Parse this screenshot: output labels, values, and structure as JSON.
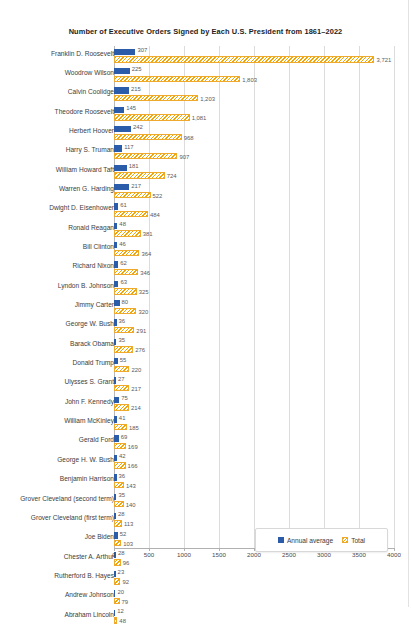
{
  "chart_data": {
    "type": "bar",
    "title": "Number of Executive Orders Signed by Each U.S. President from 1861–2022",
    "orientation": "horizontal",
    "xlabel": "",
    "ylabel": "",
    "xlim": [
      0,
      4000
    ],
    "xticks": [
      0,
      500,
      1000,
      1500,
      2000,
      2500,
      3000,
      3500,
      4000
    ],
    "grid": true,
    "legend_position": "bottom-right",
    "categories": [
      "Franklin D. Roosevelt",
      "Woodrow Wilson",
      "Calvin Coolidge",
      "Theodore Roosevelt",
      "Herbert Hoover",
      "Harry S. Truman",
      "William Howard Taft",
      "Warren G. Harding",
      "Dwight D. Eisenhower",
      "Ronald Reagan",
      "Bill Clinton",
      "Richard Nixon",
      "Lyndon B. Johnson",
      "Jimmy Carter",
      "George W. Bush",
      "Barack Obama",
      "Donald Trump",
      "Ulysses S. Grant",
      "John F. Kennedy",
      "William McKinley",
      "Gerald  Ford",
      "George H. W. Bush",
      "Benjamin Harrison",
      "Grover Cleveland (second term)",
      "Grover Cleveland (first term)",
      "Joe Biden",
      "Chester A. Arthur",
      "Rutherford B. Hayes",
      "Andrew Johnson",
      "Abraham Lincoln"
    ],
    "series": [
      {
        "name": "Annual average",
        "color": "#2a5caa",
        "values": [
          307,
          225,
          215,
          145,
          242,
          117,
          181,
          217,
          61,
          48,
          46,
          62,
          63,
          80,
          36,
          35,
          55,
          27,
          75,
          41,
          69,
          42,
          36,
          35,
          28,
          52,
          28,
          23,
          20,
          12
        ]
      },
      {
        "name": "Total",
        "color": "#f0a500",
        "values": [
          3721,
          1803,
          1203,
          1081,
          968,
          907,
          724,
          522,
          484,
          381,
          364,
          346,
          325,
          320,
          291,
          276,
          220,
          217,
          214,
          185,
          169,
          166,
          143,
          140,
          113,
          103,
          96,
          92,
          79,
          48
        ]
      }
    ],
    "value_labels": {
      "annual_average": [
        "307",
        "225",
        "215",
        "145",
        "242",
        "117",
        "181",
        "217",
        "61",
        "48",
        "46",
        "62",
        "63",
        "80",
        "36",
        "35",
        "55",
        "27",
        "75",
        "41",
        "69",
        "42",
        "36",
        "35",
        "28",
        "52",
        "28",
        "23",
        "20",
        "12"
      ],
      "total": [
        "3,721",
        "1,803",
        "1,203",
        "1,081",
        "968",
        "907",
        "724",
        "522",
        "484",
        "381",
        "364",
        "346",
        "325",
        "320",
        "291",
        "276",
        "220",
        "217",
        "214",
        "185",
        "169",
        "166",
        "143",
        "140",
        "113",
        "103",
        "96",
        "92",
        "79",
        "48"
      ]
    },
    "xtick_labels": [
      "0",
      "500",
      "1000",
      "1500",
      "2000",
      "2500",
      "3000",
      "3500",
      "4000"
    ]
  },
  "legend": {
    "items": [
      {
        "label": "Annual average"
      },
      {
        "label": "Total"
      }
    ]
  }
}
